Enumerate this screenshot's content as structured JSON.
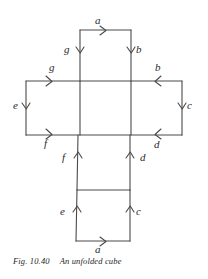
{
  "figure": {
    "caption_number": "Fig. 10.40",
    "caption_text": "An unfolded cube",
    "stroke_color": "#4a4a4a",
    "text_color": "#2b2b2b",
    "background_color": "#ffffff",
    "net_description": "unfolded cube net, cross shape of six squares",
    "squares": [
      {
        "name": "top-square",
        "x": 80,
        "y": 30,
        "w": 51,
        "h": 51
      },
      {
        "name": "middle-left-square",
        "x": 26,
        "y": 81,
        "w": 54,
        "h": 54
      },
      {
        "name": "middle-center-square",
        "x": 80,
        "y": 81,
        "w": 51,
        "h": 54
      },
      {
        "name": "middle-right-square",
        "x": 131,
        "y": 81,
        "w": 51,
        "h": 54
      },
      {
        "name": "lower-square",
        "x": 77,
        "y": 135,
        "w": 53,
        "h": 55
      },
      {
        "name": "bottom-square",
        "x": 76,
        "y": 190,
        "w": 54,
        "h": 51
      }
    ],
    "edges": [
      {
        "id": "top-a",
        "label": "a",
        "direction": "right",
        "label_x": 95,
        "label_y": 15
      },
      {
        "id": "top-left-g",
        "label": "g",
        "direction": "down",
        "label_x": 64,
        "label_y": 44
      },
      {
        "id": "top-right-b",
        "label": "b",
        "direction": "down",
        "label_x": 136,
        "label_y": 44
      },
      {
        "id": "mid-top-left-g",
        "label": "g",
        "direction": "right",
        "label_x": 49,
        "label_y": 62
      },
      {
        "id": "mid-top-right-b",
        "label": "b",
        "direction": "left",
        "label_x": 155,
        "label_y": 62
      },
      {
        "id": "mid-left-e",
        "label": "e",
        "direction": "down",
        "label_x": 13,
        "label_y": 100
      },
      {
        "id": "mid-right-c",
        "label": "c",
        "direction": "down",
        "label_x": 187,
        "label_y": 100
      },
      {
        "id": "mid-bot-left-f",
        "label": "f",
        "direction": "right",
        "label_x": 44,
        "label_y": 138
      },
      {
        "id": "mid-bot-right-d",
        "label": "d",
        "direction": "left",
        "label_x": 154,
        "label_y": 139
      },
      {
        "id": "lower-left-f",
        "label": "f",
        "direction": "up",
        "label_x": 62,
        "label_y": 152
      },
      {
        "id": "lower-right-d",
        "label": "d",
        "direction": "up",
        "label_x": 140,
        "label_y": 152
      },
      {
        "id": "bottom-left-e",
        "label": "e",
        "direction": "up",
        "label_x": 60,
        "label_y": 206
      },
      {
        "id": "bottom-right-c",
        "label": "c",
        "direction": "up",
        "label_x": 136,
        "label_y": 206
      },
      {
        "id": "bottom-a",
        "label": "a",
        "direction": "right",
        "label_x": 95,
        "label_y": 244
      }
    ]
  }
}
